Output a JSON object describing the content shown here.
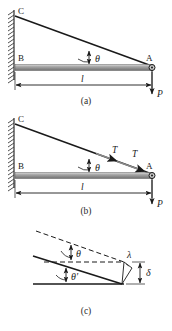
{
  "figure": {
    "panels": [
      {
        "id": "a",
        "caption": "(a)",
        "labels": {
          "point_c": "C",
          "point_b": "B",
          "point_a": "A",
          "angle": "θ",
          "length": "l",
          "load": "P"
        },
        "elements": [
          "hatched-wall",
          "vertical-wall-line",
          "cable-CA",
          "beam-BA",
          "pin-joint-A",
          "angle-arc-theta",
          "dimension-line-l",
          "load-arrow-P"
        ]
      },
      {
        "id": "b",
        "caption": "(b)",
        "labels": {
          "point_c": "C",
          "point_b": "B",
          "point_a": "A",
          "angle": "θ",
          "tension_upper": "T",
          "tension_lower": "T",
          "length": "l",
          "load": "P"
        },
        "elements": [
          "hatched-wall",
          "vertical-wall-line",
          "cable-CA",
          "beam-BA",
          "pin-joint-A",
          "angle-arc-theta",
          "tension-arrow-upper",
          "tension-arrow-lower",
          "dimension-line-l",
          "load-arrow-P"
        ]
      },
      {
        "id": "c",
        "caption": "(c)",
        "labels": {
          "angle_original": "θ",
          "angle_deformed": "θ′",
          "elongation": "λ",
          "deflection": "δ"
        },
        "elements": [
          "dashed-original-cable",
          "dashed-horizontal-reference",
          "solid-deformed-cable",
          "solid-base-line",
          "angle-arc-theta",
          "angle-arc-theta-prime",
          "elongation-marker-lambda",
          "deflection-arrow-delta"
        ]
      }
    ],
    "colors": {
      "stroke": "#1a1a1a",
      "beam_body": "#9a9a9a",
      "beam_highlight": "#d8d8d8",
      "beam_shadow": "#6e6e6e",
      "wall_hatch": "#4a4a4a",
      "background": "#ffffff"
    }
  }
}
